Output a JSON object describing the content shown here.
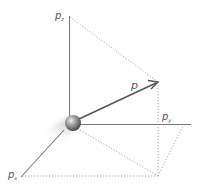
{
  "diagram": {
    "title": "",
    "colors": {
      "axis": "#777777",
      "vector": "#555555",
      "dotted": "#aaaaaa",
      "label": "#555555",
      "sphere_light": "#e8e8e8",
      "sphere_dark": "#4a4a4a"
    },
    "labels": {
      "pz": {
        "main": "p",
        "sub": "z"
      },
      "p": {
        "main": "p"
      },
      "py": {
        "main": "p",
        "sub": "y"
      },
      "px": {
        "main": "p",
        "sub": "x"
      }
    },
    "elements": [
      "sphere (particle) at origin",
      "z-axis (vertical)",
      "y-axis (horizontal right)",
      "x-axis (diagonal down-left)",
      "momentum vector p with arrowhead",
      "dotted projection lines"
    ]
  }
}
